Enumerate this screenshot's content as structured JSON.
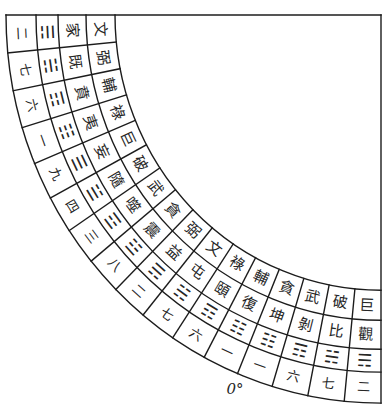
{
  "diagram": {
    "angle_label": "0°",
    "rings": {
      "stars": [
        "文",
        "弼",
        "輔",
        "祿",
        "巨",
        "破",
        "武",
        "貪",
        "弼",
        "文",
        "祿",
        "輔",
        "貪",
        "武",
        "破",
        "巨"
      ],
      "hexagrams": [
        "家",
        "既",
        "賁",
        "夷",
        "妄",
        "隨",
        "噬",
        "震",
        "益",
        "屯",
        "頤",
        "復",
        "坤",
        "剝",
        "比",
        "觀"
      ],
      "trigrams": [
        "☴",
        "☵",
        "☶",
        "☷",
        "☰",
        "☱",
        "☲",
        "☳",
        "☴",
        "☵",
        "☶",
        "☷",
        "☷",
        "☶",
        "☵",
        "☴"
      ],
      "trigram_names": [
        "xun",
        "kan",
        "gen",
        "kun",
        "qian",
        "dui",
        "li",
        "zhen",
        "xun",
        "kan",
        "gen",
        "kun",
        "kun",
        "gen",
        "kan",
        "xun"
      ],
      "numbers": [
        "二",
        "七",
        "六",
        "一",
        "九",
        "四",
        "三",
        "八",
        "二",
        "七",
        "六",
        "一",
        "一",
        "六",
        "七",
        "二"
      ]
    }
  }
}
